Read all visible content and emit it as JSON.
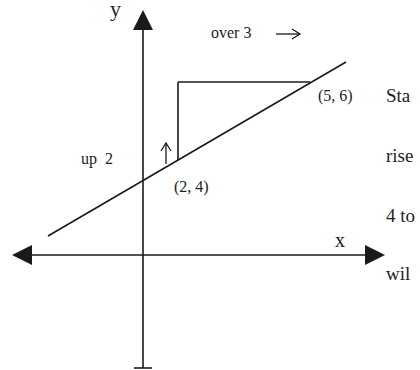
{
  "diagram": {
    "axes": {
      "x_label": "x",
      "y_label": "y"
    },
    "points": [
      {
        "label": "(2, 4)",
        "x": 2,
        "y": 4
      },
      {
        "label": "(5, 6)",
        "x": 5,
        "y": 6
      }
    ],
    "annotations": {
      "rise_label": "up  2",
      "rise_arrow": "↑",
      "run_label": "over 3",
      "run_arrow": "→"
    },
    "slope": {
      "rise": 2,
      "run": 3
    },
    "colors": {
      "ink": "#1a1a1a",
      "background": "#ffffff"
    }
  },
  "side_text": {
    "lines": [
      "Sta",
      "rise",
      "4 to",
      "wil"
    ]
  }
}
